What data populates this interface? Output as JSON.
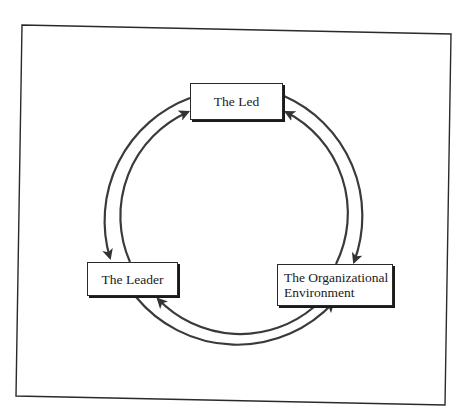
{
  "diagram": {
    "type": "cycle",
    "nodes": [
      {
        "id": "led",
        "label": "The Led"
      },
      {
        "id": "leader",
        "label": "The Leader"
      },
      {
        "id": "environment",
        "label_line1": "The Organizational",
        "label_line2": "Environment"
      }
    ],
    "edges": [
      {
        "from": "led",
        "to": "leader",
        "path": "outer-left"
      },
      {
        "from": "leader",
        "to": "led",
        "path": "inner-left"
      },
      {
        "from": "led",
        "to": "environment",
        "path": "outer-right"
      },
      {
        "from": "environment",
        "to": "led",
        "path": "inner-right"
      },
      {
        "from": "leader",
        "to": "environment",
        "path": "outer-bottom"
      },
      {
        "from": "environment",
        "to": "leader",
        "path": "inner-bottom"
      }
    ]
  },
  "colors": {
    "line": "#3a3a3a",
    "frame": "#2a2a2a",
    "background": "#ffffff"
  }
}
